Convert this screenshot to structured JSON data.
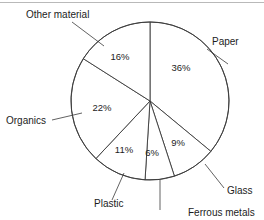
{
  "chart_data": {
    "type": "pie",
    "title": "",
    "subtitle": "",
    "xlabel": "",
    "ylabel": "",
    "units": "%",
    "start_angle_deg": 0,
    "direction": "clockwise",
    "legend_position": "none",
    "grid": false,
    "categories": [
      "Paper",
      "Glass",
      "Ferrous metals",
      "Plastic",
      "Organics",
      "Other material"
    ],
    "values": [
      36,
      9,
      6,
      11,
      22,
      16
    ],
    "total": 100,
    "slices": [
      {
        "label": "Paper",
        "value": 36,
        "value_label": "36%",
        "start_deg": 0,
        "end_deg": 129.6,
        "pct_x": 181,
        "pct_y": 71,
        "label_x": 212,
        "label_y": 45,
        "leader": {
          "x1": 207,
          "y1": 49,
          "x2": 228,
          "y2": 64
        }
      },
      {
        "label": "Glass",
        "value": 9,
        "value_label": "9%",
        "start_deg": 129.6,
        "end_deg": 162.0,
        "pct_x": 178,
        "pct_y": 146,
        "label_x": 227,
        "label_y": 194,
        "leader": {
          "x1": 224,
          "y1": 188,
          "x2": 205,
          "y2": 164
        }
      },
      {
        "label": "Ferrous metals",
        "value": 6,
        "value_label": "6%",
        "start_deg": 162.0,
        "end_deg": 183.6,
        "pct_x": 152,
        "pct_y": 156,
        "label_x": 188,
        "label_y": 216,
        "leader": {
          "x1": 160,
          "y1": 210,
          "x2": 160,
          "y2": 180
        }
      },
      {
        "label": "Plastic",
        "value": 11,
        "value_label": "11%",
        "start_deg": 183.6,
        "end_deg": 223.2,
        "pct_x": 124,
        "pct_y": 153,
        "label_x": 94,
        "label_y": 207,
        "leader": {
          "x1": 112,
          "y1": 200,
          "x2": 124,
          "y2": 173
        }
      },
      {
        "label": "Organics",
        "value": 22,
        "value_label": "22%",
        "start_deg": 223.2,
        "end_deg": 302.4,
        "pct_x": 102,
        "pct_y": 111,
        "label_x": 6,
        "label_y": 124,
        "leader": {
          "x1": 52,
          "y1": 120,
          "x2": 82,
          "y2": 113
        }
      },
      {
        "label": "Other material",
        "value": 16,
        "value_label": "16%",
        "start_deg": 302.4,
        "end_deg": 360.0,
        "pct_x": 120,
        "pct_y": 60,
        "label_x": 26,
        "label_y": 18,
        "leader": {
          "x1": 72,
          "y1": 22,
          "x2": 104,
          "y2": 46
        }
      }
    ],
    "geometry": {
      "center_x": 150,
      "center_y": 101,
      "radius": 79
    }
  }
}
